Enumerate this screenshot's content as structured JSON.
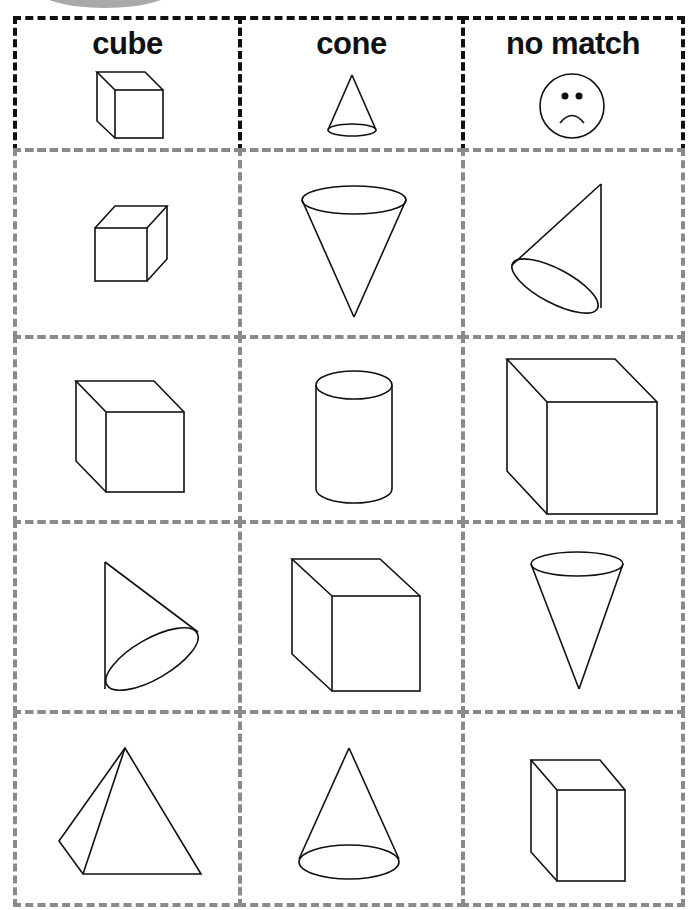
{
  "worksheet": {
    "header": [
      {
        "label": "cube",
        "icon": "cube-icon"
      },
      {
        "label": "cone",
        "icon": "cone-icon"
      },
      {
        "label": "no match",
        "icon": "sad-face-icon"
      }
    ],
    "rows": [
      [
        "cube",
        "inverted-cone",
        "tilted-cone"
      ],
      [
        "cube",
        "cylinder",
        "cube"
      ],
      [
        "tilted-cone",
        "cube",
        "inverted-cone"
      ],
      [
        "pyramid",
        "cone",
        "cube"
      ]
    ],
    "colors": {
      "header_border": "#111111",
      "cell_border": "#8a8a8a",
      "stroke": "#111111",
      "arc": "#a9a9a9"
    }
  }
}
